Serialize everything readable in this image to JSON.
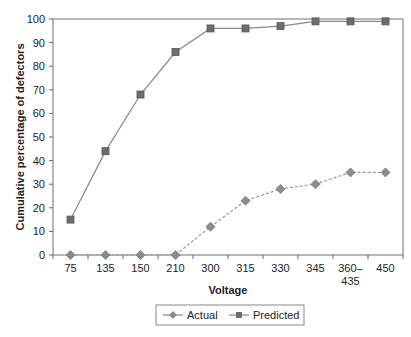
{
  "chart_data": {
    "type": "line",
    "title": "",
    "xlabel": "Voltage",
    "ylabel": "Cumulative percentage of defectors",
    "categories": [
      "75",
      "135",
      "150",
      "210",
      "300",
      "315",
      "330",
      "345",
      "360–435",
      "450"
    ],
    "category_lines": [
      [
        "75"
      ],
      [
        "135"
      ],
      [
        "150"
      ],
      [
        "210"
      ],
      [
        "300"
      ],
      [
        "315"
      ],
      [
        "330"
      ],
      [
        "345"
      ],
      [
        "360–",
        "435"
      ],
      [
        "450"
      ]
    ],
    "ylim": [
      0,
      100
    ],
    "yticks": [
      0,
      10,
      20,
      30,
      40,
      50,
      60,
      70,
      80,
      90,
      100
    ],
    "grid": false,
    "legend_position": "bottom",
    "series": [
      {
        "name": "Actual",
        "marker": "diamond",
        "line": "dashed",
        "color": "#888888",
        "values": [
          0,
          0,
          0,
          0,
          12,
          23,
          28,
          30,
          35,
          35
        ]
      },
      {
        "name": "Predicted",
        "marker": "square",
        "line": "solid",
        "color": "#666666",
        "values": [
          15,
          44,
          68,
          86,
          96,
          96,
          97,
          99,
          99,
          99
        ]
      }
    ]
  }
}
